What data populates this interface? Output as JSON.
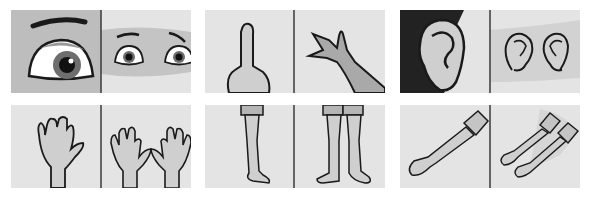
{
  "layout": {
    "rows": 2,
    "columns": 3,
    "panels_per_card": 2
  },
  "colors": {
    "panel_bg": "#e4e4e4",
    "panel_bg_dark": "#bdbdbd",
    "band": "#c8c8c8",
    "skin": "#cfcfcf",
    "skin_dark": "#a9a9a9",
    "outline": "#1a1a1a",
    "divider": "#3a3a3a",
    "ear_bg": "#222222"
  },
  "cards": [
    {
      "name": "eyes",
      "left": "single-eye",
      "right": "pair-of-eyes"
    },
    {
      "name": "fingers",
      "left": "one-finger",
      "right": "three-fingers"
    },
    {
      "name": "ears",
      "left": "single-ear",
      "right": "pair-of-ears"
    },
    {
      "name": "hands",
      "left": "one-hand",
      "right": "two-hands"
    },
    {
      "name": "legs",
      "left": "one-leg",
      "right": "two-legs"
    },
    {
      "name": "arms",
      "left": "one-arm",
      "right": "two-arms"
    }
  ]
}
